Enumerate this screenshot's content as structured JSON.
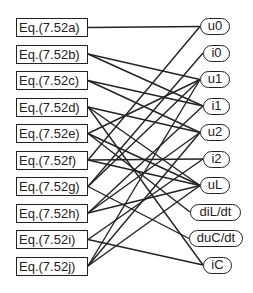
{
  "equations": [
    {
      "id": "a",
      "label": "Eq.(7.52a)"
    },
    {
      "id": "b",
      "label": "Eq.(7.52b)"
    },
    {
      "id": "c",
      "label": "Eq.(7.52c)"
    },
    {
      "id": "d",
      "label": "Eq.(7.52d)"
    },
    {
      "id": "e",
      "label": "Eq.(7.52e)"
    },
    {
      "id": "f",
      "label": "Eq.(7.52f)"
    },
    {
      "id": "g",
      "label": "Eq.(7.52g)"
    },
    {
      "id": "h",
      "label": "Eq.(7.52h)"
    },
    {
      "id": "i",
      "label": "Eq.(7.52i)"
    },
    {
      "id": "j",
      "label": "Eq.(7.52j)"
    }
  ],
  "variables": [
    {
      "id": "u0",
      "label": "u0"
    },
    {
      "id": "i0",
      "label": "i0"
    },
    {
      "id": "u1",
      "label": "u1"
    },
    {
      "id": "i1",
      "label": "i1"
    },
    {
      "id": "u2",
      "label": "u2"
    },
    {
      "id": "i2",
      "label": "i2"
    },
    {
      "id": "uL",
      "label": "uL"
    },
    {
      "id": "diLdt",
      "label": "diL/dt"
    },
    {
      "id": "duCdt",
      "label": "duC/dt"
    },
    {
      "id": "iC",
      "label": "iC"
    }
  ],
  "edges": [
    [
      "a",
      "u0"
    ],
    [
      "b",
      "u1"
    ],
    [
      "b",
      "i1"
    ],
    [
      "c",
      "i1"
    ],
    [
      "c",
      "u2"
    ],
    [
      "d",
      "u2"
    ],
    [
      "d",
      "uL"
    ],
    [
      "d",
      "iC"
    ],
    [
      "e",
      "u1"
    ],
    [
      "e",
      "uL"
    ],
    [
      "e",
      "diLdt"
    ],
    [
      "f",
      "u0"
    ],
    [
      "f",
      "i2"
    ],
    [
      "f",
      "uL"
    ],
    [
      "g",
      "i0"
    ],
    [
      "g",
      "u1"
    ],
    [
      "g",
      "duCdt"
    ],
    [
      "h",
      "i1"
    ],
    [
      "h",
      "u2"
    ],
    [
      "h",
      "uL"
    ],
    [
      "i",
      "i2"
    ],
    [
      "i",
      "iC"
    ],
    [
      "j",
      "u1"
    ],
    [
      "j",
      "u2"
    ],
    [
      "j",
      "uL"
    ]
  ],
  "colors": {
    "stroke": "#222222",
    "background": "#ffffff"
  }
}
